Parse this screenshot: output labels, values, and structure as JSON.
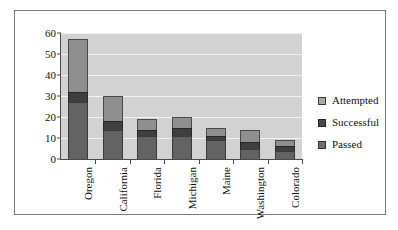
{
  "chart_data": {
    "type": "bar",
    "stacked": true,
    "title": "",
    "subtitle": "",
    "xlabel": "",
    "ylabel": "",
    "ylim": [
      0,
      60
    ],
    "ytick_step": 10,
    "yticks": [
      0,
      10,
      20,
      30,
      40,
      50,
      60
    ],
    "grid": true,
    "grid_axis": "y",
    "legend_position": "right",
    "categories": [
      "Oregon",
      "California",
      "Florida",
      "Michigan",
      "Maine",
      "Washington",
      "Colorado"
    ],
    "series": [
      {
        "name": "Passed",
        "color": "#636363",
        "values": [
          27,
          14,
          11,
          11,
          9,
          5,
          4
        ]
      },
      {
        "name": "Successful",
        "color": "#3f3f3f",
        "values": [
          5,
          4,
          3,
          4,
          2,
          3,
          2
        ]
      },
      {
        "name": "Attempted",
        "color": "#8f8f8f",
        "values": [
          25,
          12,
          5,
          5,
          4,
          6,
          3
        ]
      }
    ],
    "series_order_bottom_to_top": [
      "Passed",
      "Successful",
      "Attempted"
    ],
    "totals": [
      57,
      30,
      19,
      20,
      15,
      14,
      9
    ]
  },
  "legend": {
    "items": [
      {
        "label": "Attempted",
        "swatch": "attempted-swatch"
      },
      {
        "label": "Successful",
        "swatch": "successful-swatch"
      },
      {
        "label": "Passed",
        "swatch": "passed-swatch"
      }
    ]
  },
  "colors": {
    "plot_background": "#d2d2d2",
    "gridline": "#f2f2f2",
    "axis": "#4a4a4a",
    "frame": "#7b7b7b",
    "page_background": "#ffffff"
  }
}
